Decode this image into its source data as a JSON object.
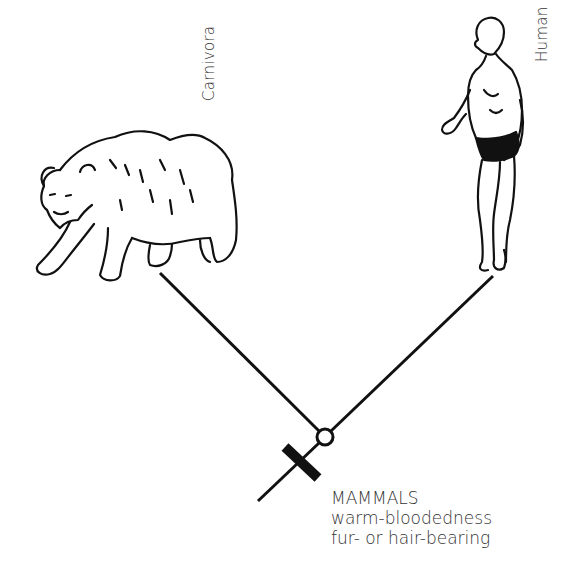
{
  "diagram": {
    "type": "cladogram",
    "taxa": [
      {
        "label": "Carnivora",
        "illustration": "bear-illustration"
      },
      {
        "label": "Human",
        "illustration": "human-illustration"
      }
    ],
    "clade": {
      "name": "MAMMALS",
      "traits": [
        "warm-bloodedness",
        "fur- or hair-bearing"
      ]
    },
    "node_marker": "open-circle",
    "synapomorphy_marker": "crossbar",
    "colors": {
      "line": "#111111",
      "text": "#333333",
      "background": "#ffffff"
    }
  }
}
